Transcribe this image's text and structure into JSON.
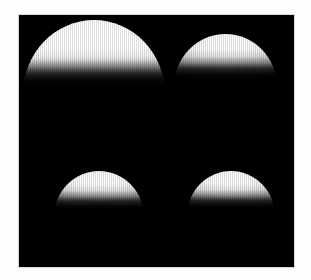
{
  "figure": {
    "background_color": "#fdfdfd",
    "panel_background_color": "#000000",
    "panel_border_color": "#d8d8d8",
    "highlight_color": "#ffffff",
    "caption": ""
  },
  "panel": {
    "name": "image-panel",
    "objects": [
      {
        "id": "dome-top-left",
        "position": "top-left",
        "label": "",
        "brightness": "brightest",
        "shape": "dome"
      },
      {
        "id": "dome-top-right",
        "position": "top-right",
        "label": "",
        "brightness": "bright",
        "shape": "dome"
      },
      {
        "id": "dome-bottom-left",
        "position": "bottom-left",
        "label": "",
        "brightness": "bright",
        "shape": "dome"
      },
      {
        "id": "dome-bottom-right",
        "position": "bottom-right",
        "label": "",
        "brightness": "bright",
        "shape": "dome"
      }
    ]
  }
}
